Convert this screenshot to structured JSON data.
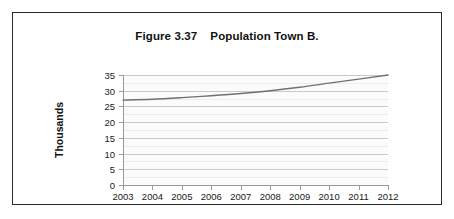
{
  "figure": {
    "title": "Figure 3.37    Population Town B.",
    "border_color": "#2b2b2b",
    "background": "#ffffff"
  },
  "chart_data": {
    "type": "line",
    "title": "Figure 3.37    Population Town B.",
    "xlabel": "",
    "ylabel": "Thousands",
    "x": [
      2003,
      2004,
      2005,
      2006,
      2007,
      2008,
      2009,
      2010,
      2011,
      2012
    ],
    "categories": [
      "2003",
      "2004",
      "2005",
      "2006",
      "2007",
      "2008",
      "2009",
      "2010",
      "2011",
      "2012"
    ],
    "series": [
      {
        "name": "Population Town B",
        "values": [
          27.0,
          27.3,
          27.8,
          28.4,
          29.1,
          30.0,
          31.1,
          32.4,
          33.7,
          35.0
        ],
        "color": "#707070"
      }
    ],
    "ylim": [
      0,
      35
    ],
    "yticks": [
      0,
      5,
      10,
      15,
      20,
      25,
      30,
      35
    ],
    "ytick_labels": [
      "0",
      "5",
      "10",
      "15",
      "20",
      "25",
      "30",
      "35"
    ],
    "xlim": [
      2003,
      2012
    ],
    "grid": true,
    "minor_grid": true,
    "legend": false,
    "legend_position": "none",
    "plot_background": "#fbfbfb",
    "grid_color": "#c9c9c9",
    "axis_color": "#9a9a9a"
  }
}
